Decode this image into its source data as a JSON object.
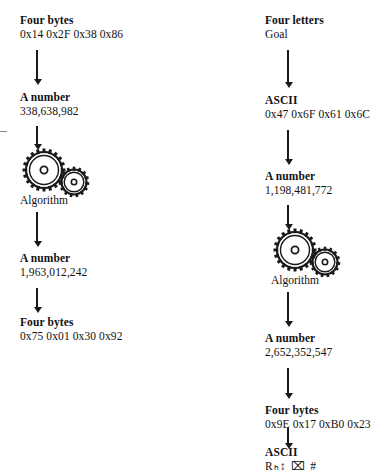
{
  "diagram": {
    "algorithm_caption": "Algorithm",
    "gear_icon_name": "gears-algorithm-icon",
    "left_column": {
      "name": "decoding-flow",
      "steps": [
        {
          "label": "Four bytes",
          "value": "0x14 0x2F 0x38 0x86"
        },
        {
          "label": "A number",
          "value": "338,638,982"
        },
        {
          "label": "Algorithm",
          "value": ""
        },
        {
          "label": "A number",
          "value": "1,963,012,242"
        },
        {
          "label": "Four bytes",
          "value": "0x75 0x01 0x30 0x92"
        }
      ]
    },
    "right_column": {
      "name": "encoding-flow",
      "steps": [
        {
          "label": "Four letters",
          "value": "Goal"
        },
        {
          "label": "ASCII",
          "value": "0x47 0x6F 0x61 0x6C"
        },
        {
          "label": "A number",
          "value": "1,198,481,772"
        },
        {
          "label": "Algorithm",
          "value": ""
        },
        {
          "label": "A number",
          "value": "2,652,352,547"
        },
        {
          "label": "Four bytes",
          "value": "0x9E 0x17 0xB0 0x23"
        },
        {
          "label": "ASCII",
          "value": "Rₕ↕ ⌧ #"
        }
      ]
    }
  }
}
